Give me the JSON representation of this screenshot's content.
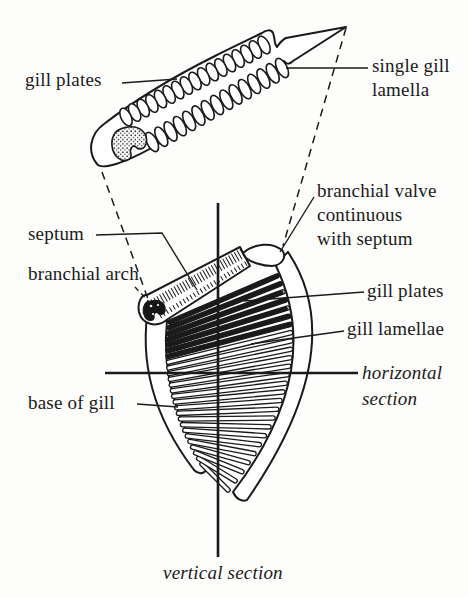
{
  "figure": {
    "colors": {
      "ink": "#1a1a1a",
      "background": "#fdfdfc"
    },
    "labels": {
      "gill_plates_top": "gill plates",
      "single_gill_lamella": {
        "line1": "single gill",
        "line2": "lamella"
      },
      "septum": "septum",
      "branchial_arch": "branchial arch",
      "branchial_valve": {
        "line1": "branchial valve",
        "line2": "continuous",
        "line3": "with septum"
      },
      "gill_plates_right": "gill plates",
      "gill_lamellae": "gill lamellae",
      "horizontal_section": {
        "line1": "horizontal",
        "line2": "section"
      },
      "base_of_gill": "base of gill",
      "vertical_section": "vertical section"
    }
  }
}
